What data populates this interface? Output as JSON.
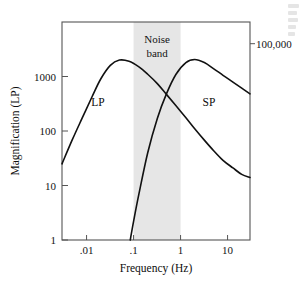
{
  "figure": {
    "background_color": "#ffffff",
    "frame_color": "#4d4d4d",
    "curve_color": "#111111",
    "band_color": "#e6e6e6"
  },
  "chart_data": {
    "type": "line",
    "title": "",
    "subtitle": "",
    "xlabel": "Frequency (Hz)",
    "ylabel": "Magnification (LP)",
    "xscale": "log",
    "yscale": "log",
    "xlim": [
      0.003,
      30
    ],
    "ylim": [
      1,
      10000
    ],
    "grid": false,
    "legend_position": "inline-curve-labels",
    "xticks": [
      0.01,
      0.1,
      1,
      10
    ],
    "xtick_labels": [
      ".01",
      ".1",
      "1",
      "10"
    ],
    "yticks": [
      1,
      10,
      100,
      1000
    ],
    "ytick_labels": [
      "1",
      "10",
      "100",
      "1000"
    ],
    "secondary_axis": {
      "side": "right",
      "ticks": [
        4000
      ],
      "tick_labels": [
        "100,000"
      ]
    },
    "annotations": [
      {
        "name": "noise-band",
        "text": "Noise band",
        "line1": "Noise",
        "line2": "band",
        "x_start": 0.1,
        "x_end": 1.0
      },
      {
        "name": "lp-curve-label",
        "text": "LP",
        "x": 0.02,
        "y": 3300
      },
      {
        "name": "sp-curve-label",
        "text": "SP",
        "x": 1.6,
        "y": 3300
      }
    ],
    "series": [
      {
        "name": "LP",
        "label": "LP",
        "color": "#111111",
        "x": [
          0.003,
          0.005,
          0.008,
          0.013,
          0.02,
          0.032,
          0.05,
          0.08,
          0.13,
          0.2,
          0.32,
          0.5,
          0.8,
          1.3,
          2.0,
          3.2,
          5.0,
          8.0,
          13.0,
          20.0,
          30.0
        ],
        "y": [
          25,
          70,
          170,
          420,
          900,
          1600,
          2000,
          1900,
          1500,
          1100,
          740,
          470,
          290,
          175,
          110,
          68,
          44,
          29,
          21,
          16,
          14
        ]
      },
      {
        "name": "SP",
        "label": "SP",
        "color": "#111111",
        "x": [
          0.085,
          0.1,
          0.13,
          0.2,
          0.32,
          0.5,
          0.8,
          1.3,
          2.0,
          3.2,
          5.0,
          8.0,
          13.0,
          20.0,
          30.0
        ],
        "y": [
          1,
          2.2,
          7,
          40,
          170,
          480,
          1100,
          1800,
          2050,
          1800,
          1400,
          1050,
          790,
          610,
          480
        ]
      }
    ]
  },
  "margin_text": {
    "present": true,
    "legible": false,
    "line_count": 5
  }
}
